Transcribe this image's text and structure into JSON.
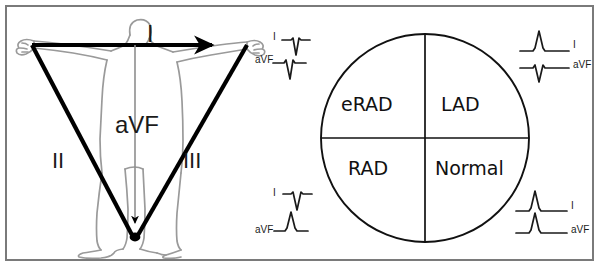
{
  "figure": {
    "panels": [
      "einthoven-triangle",
      "axis-quadrant-circle"
    ]
  },
  "colors": {
    "frame_border": "#7a7a7a",
    "body_outline": "#999999",
    "triangle": "#000000",
    "circle": "#111111",
    "text": "#1a1a1a",
    "background": "#ffffff"
  },
  "left_panel": {
    "name": "einthoven-triangle",
    "body_figure_label": "human-body-outline",
    "leads": [
      {
        "name": "I",
        "label": "I",
        "orientation": "horizontal-rightward",
        "arrow": "right"
      },
      {
        "name": "II",
        "label": "II",
        "orientation": "diagonal-down-right",
        "arrow": "down"
      },
      {
        "name": "III",
        "label": "III",
        "orientation": "diagonal-down-left",
        "arrow": "down"
      },
      {
        "name": "aVF",
        "label": "aVF",
        "orientation": "vertical-downward",
        "arrow": "down"
      }
    ]
  },
  "right_panel": {
    "name": "axis-quadrant-circle",
    "quadrants": [
      {
        "position": "upper-left",
        "label": "eRAD",
        "lead_I": "negative",
        "lead_aVF": "negative"
      },
      {
        "position": "upper-right",
        "label": "LAD",
        "lead_I": "positive",
        "lead_aVF": "negative"
      },
      {
        "position": "lower-left",
        "label": "RAD",
        "lead_I": "negative",
        "lead_aVF": "positive"
      },
      {
        "position": "lower-right",
        "label": "Normal",
        "lead_I": "positive",
        "lead_aVF": "positive"
      }
    ],
    "ecg_groups": [
      {
        "name": "ecg-upper-left",
        "label_side": "left",
        "traces": [
          {
            "lead_label": "I",
            "deflection": "negative"
          },
          {
            "lead_label": "aVF",
            "deflection": "negative"
          }
        ]
      },
      {
        "name": "ecg-upper-right",
        "label_side": "right",
        "traces": [
          {
            "lead_label": "I",
            "deflection": "positive"
          },
          {
            "lead_label": "aVF",
            "deflection": "negative"
          }
        ]
      },
      {
        "name": "ecg-lower-left",
        "label_side": "left",
        "traces": [
          {
            "lead_label": "I",
            "deflection": "negative"
          },
          {
            "lead_label": "aVF",
            "deflection": "positive"
          }
        ]
      },
      {
        "name": "ecg-lower-right",
        "label_side": "right",
        "traces": [
          {
            "lead_label": "I",
            "deflection": "positive"
          },
          {
            "lead_label": "aVF",
            "deflection": "positive"
          }
        ]
      }
    ]
  }
}
